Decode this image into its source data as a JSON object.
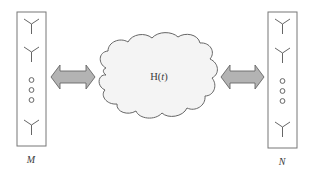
{
  "diagram": {
    "type": "MIMO channel diagram",
    "transmitter": {
      "label": "M",
      "antenna_count_shown": 3,
      "ellipsis": "vertical dots"
    },
    "channel": {
      "label_main": "H(",
      "label_var": "t",
      "label_close": ")",
      "shape": "cloud"
    },
    "receiver": {
      "label": "N",
      "antenna_count_shown": 3,
      "ellipsis": "vertical dots"
    },
    "links": [
      {
        "from": "transmitter",
        "to": "channel",
        "style": "double-headed block arrow"
      },
      {
        "from": "channel",
        "to": "receiver",
        "style": "double-headed block arrow"
      }
    ],
    "colors": {
      "stroke": "#666666",
      "arrow_fill": "#b3b3b3",
      "cloud_fill": "#f4f4f4",
      "text": "#3a3a3a"
    }
  }
}
